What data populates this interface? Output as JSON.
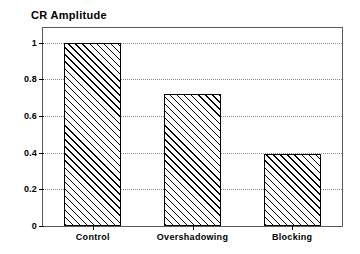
{
  "chart_data": {
    "type": "bar",
    "title": "CR Amplitude",
    "xlabel": "",
    "ylabel": "",
    "categories": [
      "Control",
      "Overshadowing",
      "Blocking"
    ],
    "values": [
      1.0,
      0.72,
      0.395
    ],
    "ylim": [
      0,
      1.08
    ],
    "yticks": [
      0,
      0.2,
      0.4,
      0.6,
      0.8,
      1
    ],
    "ytick_labels": [
      "0",
      "0.2",
      "0.4",
      "0.6",
      "0.8",
      "1"
    ],
    "grid": "horizontal-dotted",
    "legend": "none",
    "bar_fill": "diagonal-hatch",
    "bar_edge_color": "#000000",
    "frame_color": "#5a5a5a",
    "grid_color": "#8d8d8d",
    "series": [
      {
        "name": "CR Amplitude",
        "values": [
          1.0,
          0.72,
          0.395
        ]
      }
    ]
  }
}
